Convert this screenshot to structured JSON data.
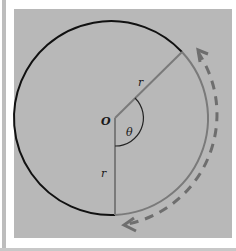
{
  "diagram": {
    "labels": {
      "origin": "O",
      "radius_upper": "r",
      "radius_lower": "r",
      "angle": "θ"
    },
    "colors": {
      "panel": "#b8b8b8",
      "circle_black_arc": "#111111",
      "circle_gray_arc": "#7a7a7a",
      "radii": "#7a7a7a",
      "dashed_arrow": "#6e6e6e"
    },
    "geometry": {
      "center": [
        115,
        118
      ],
      "radius": 97,
      "upper_radius_end": [
        182,
        52
      ],
      "lower_radius_end": [
        115,
        215
      ]
    }
  }
}
